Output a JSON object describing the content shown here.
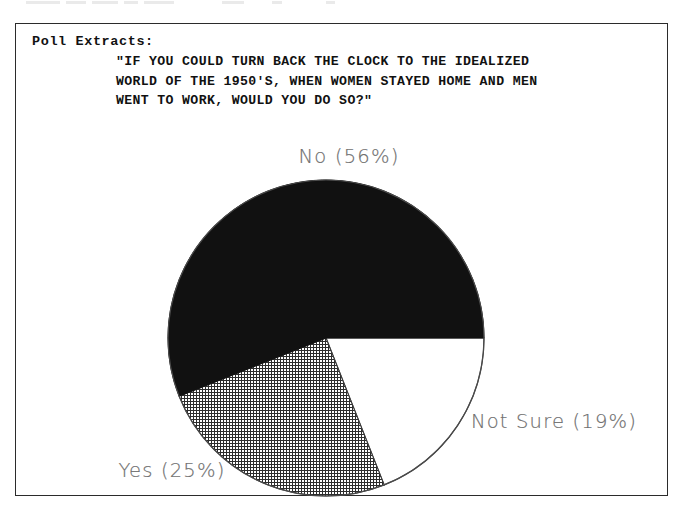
{
  "document": {
    "top_clipped_artifact": "",
    "frame_border_color": "#2b2b2b",
    "background_color": "#ffffff"
  },
  "caption": {
    "heading": "Poll Extracts:",
    "quote_lines": [
      "\"IF YOU COULD TURN BACK THE CLOCK TO THE IDEALIZED",
      "WORLD OF THE 1950'S, WHEN WOMEN STAYED HOME AND MEN",
      "WENT TO WORK, WOULD YOU DO SO?\""
    ]
  },
  "chart_data": {
    "type": "pie",
    "title": "\"IF YOU COULD TURN BACK THE CLOCK TO THE IDEALIZED WORLD OF THE 1950'S, WHEN WOMEN STAYED HOME AND MEN WENT TO WORK, WOULD YOU DO SO?\"",
    "xlabel": "",
    "ylabel": "",
    "units": "percent",
    "total": 100,
    "legend_position": "outside-labels",
    "grid": false,
    "categories": [
      "No",
      "Yes",
      "Not Sure"
    ],
    "values": [
      56,
      25,
      19
    ],
    "slices": [
      {
        "name": "No",
        "value": 56,
        "label": "No  (56%)",
        "fill_style": "solid-black",
        "fill_color": "#111111",
        "label_x": 333,
        "label_y": 38
      },
      {
        "name": "Yes",
        "value": 25,
        "label": "Yes  (25%)",
        "fill_style": "cross-hatch",
        "fill_color": "#ffffff",
        "hatch_color": "#2d2d2d",
        "label_x": 156,
        "label_y": 352
      },
      {
        "name": "Not Sure",
        "value": 19,
        "label": "Not Sure  (19%)",
        "fill_style": "blank-white",
        "fill_color": "#ffffff",
        "label_x": 538,
        "label_y": 303
      }
    ],
    "geometry": {
      "center_x": 310,
      "center_y": 219,
      "radius": 158,
      "start_angle_deg": 0,
      "direction": "counterclockwise",
      "outline_color": "#4a4a4a"
    }
  }
}
